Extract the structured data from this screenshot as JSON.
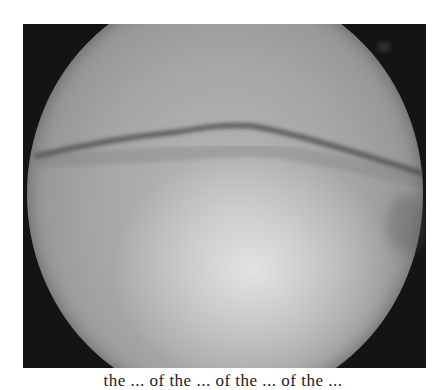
{
  "figure": {
    "type": "arthroscopic-endoscopic-view",
    "background_color": "#141414",
    "scope_field_color": "#a7a7a7",
    "highlight_color": "#e6e6e6",
    "fold_line_color": "#4a4a4a"
  },
  "caption": {
    "text": "the ... of the ... of the ... of the ..."
  }
}
